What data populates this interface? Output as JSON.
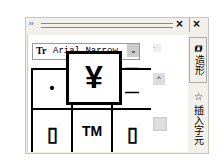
{
  "window": {
    "grip": "››",
    "close1": "×",
    "close2": "×"
  },
  "font_select": {
    "icon": "Tr",
    "value": "Arial Narrow",
    "dropdown": "⌄"
  },
  "glyph_grid": {
    "preview": "¥",
    "cells": [
      "•",
      "",
      "",
      "▯",
      "TM",
      "▯"
    ],
    "right_partial": [
      "—",
      "—"
    ]
  },
  "scrollbar": {
    "up": "^",
    "mini": "·"
  },
  "tabs": [
    {
      "label": "造形",
      "icon": "shaping-icon"
    },
    {
      "label": "插入字元",
      "icon": "star-icon"
    }
  ]
}
